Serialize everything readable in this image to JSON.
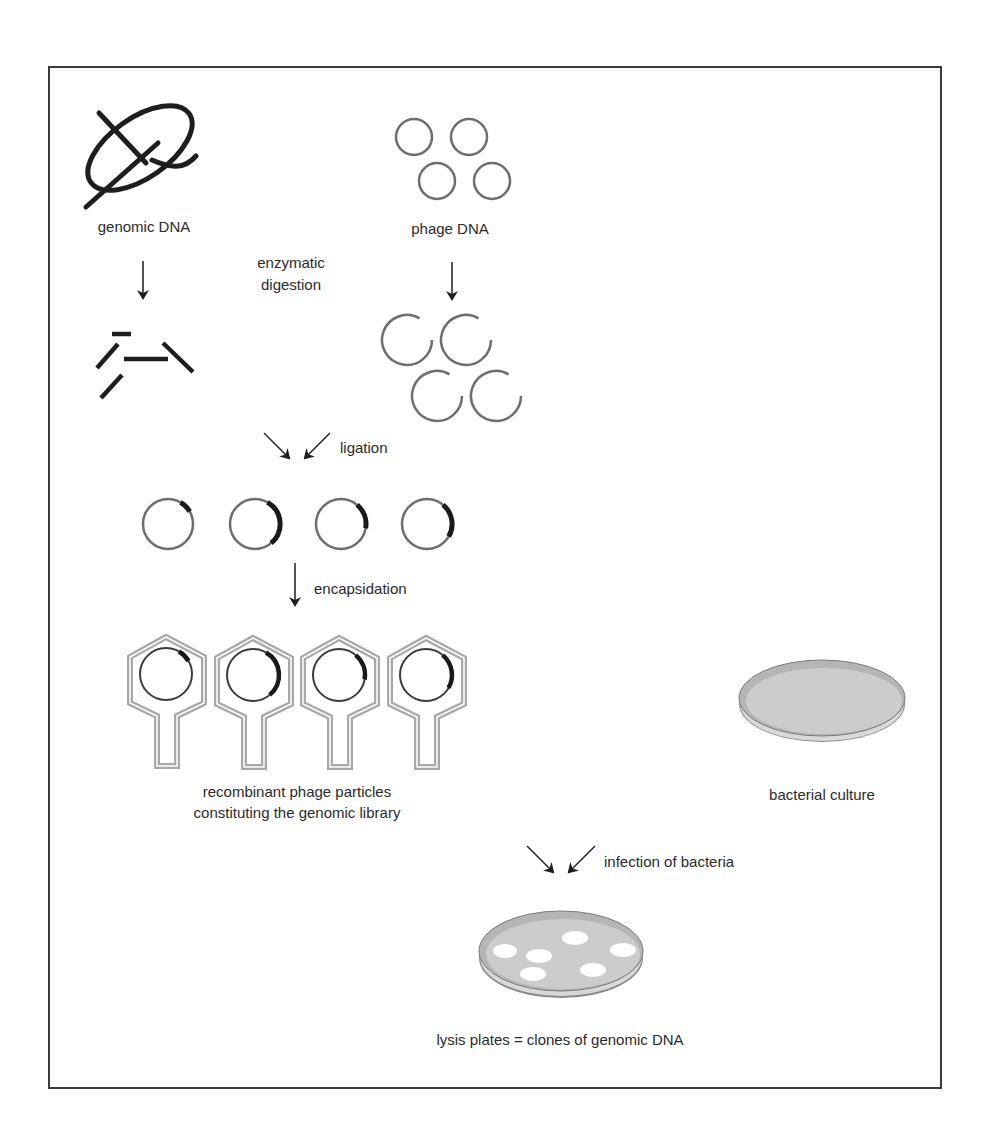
{
  "figure": {
    "colors": {
      "frame": "#3a3a3a",
      "strand": "#1e1e1e",
      "phage_dna": "#6e6e6e",
      "insert": "#1a1a1a",
      "capsid": "#a8a8a8",
      "plate_fill": "#c9c9c9",
      "plate_rim": "#8a8a8a",
      "plaque": "#ffffff",
      "text": "#2b2b2b"
    },
    "labels": {
      "genomic_dna": "genomic DNA",
      "phage_dna": "phage DNA",
      "enzymatic_line1": "enzymatic",
      "enzymatic_line2": "digestion",
      "ligation": "ligation",
      "encapsidation": "encapsidation",
      "library_line1": "recombinant phage particles",
      "library_line2": "constituting the genomic library",
      "bacterial_culture": "bacterial culture",
      "infection": "infection of bacteria",
      "lysis": "lysis plates = clones of genomic DNA"
    },
    "steps": [
      {
        "id": "genomic-dna",
        "label_key": "genomic_dna"
      },
      {
        "id": "phage-dna",
        "label_key": "phage_dna"
      },
      {
        "id": "digestion",
        "label_key": "enzymatic_line1"
      },
      {
        "id": "ligation",
        "label_key": "ligation"
      },
      {
        "id": "encapsidation",
        "label_key": "encapsidation"
      },
      {
        "id": "library",
        "label_key": "library_line1"
      },
      {
        "id": "bacterial-culture",
        "label_key": "bacterial_culture"
      },
      {
        "id": "infection",
        "label_key": "infection"
      },
      {
        "id": "lysis-plates",
        "label_key": "lysis"
      }
    ],
    "counts": {
      "phage_circles": 4,
      "open_phage_circles": 4,
      "genomic_fragments": 5,
      "recombinant_molecules": 4,
      "phage_particles": 4,
      "plaques": 6
    }
  }
}
